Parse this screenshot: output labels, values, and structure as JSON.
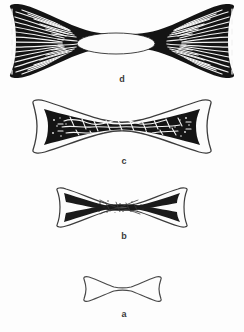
{
  "figure": {
    "background_color": "#fdfdfd",
    "ink_color": "#1a1a1a",
    "outline_color": "#4a4a4a",
    "label_color": "#3a3a3a",
    "orientation": "vertical stack, labels beneath each specimen"
  },
  "specimens": [
    {
      "id": "d",
      "label": "d",
      "order_from_top": 1,
      "width_px": 230,
      "height_px": 62,
      "center_x": 122,
      "center_y": 41,
      "fill": "solid-black-cortex",
      "internal_texture": "radiating fan trabeculae",
      "has_medullary_cavity": true,
      "cavity_width_px": 78,
      "cavity_height_px": 22,
      "description": "Largest specimen; strongly flared ends filled with dense fan-shaped radiating trabeculae, thick black cortex and a large open elliptical medullary cavity at the midshaft."
    },
    {
      "id": "c",
      "label": "c",
      "order_from_top": 2,
      "width_px": 186,
      "height_px": 52,
      "center_x": 122,
      "center_y": 126,
      "fill": "black-midshaft-with-open-ends",
      "internal_texture": "reticular mesh trabeculae",
      "has_medullary_cavity": false,
      "description": "Flared hollow ends with pale interiors; midshaft occupied by a thick black band carrying a coarse reticular mesh of trabeculae."
    },
    {
      "id": "b",
      "label": "b",
      "order_from_top": 3,
      "width_px": 136,
      "height_px": 38,
      "center_x": 122,
      "center_y": 207,
      "fill": "thin-black-margins",
      "internal_texture": "sparse stippled trabeculae",
      "has_medullary_cavity": false,
      "description": "Smaller hourglass outline with thin dark upper and lower cortical margins and a small patch of sparse stippled trabecular texture at the centre."
    },
    {
      "id": "a",
      "label": "a",
      "order_from_top": 4,
      "width_px": 82,
      "height_px": 24,
      "center_x": 122,
      "center_y": 289,
      "fill": "outline-only",
      "internal_texture": "none",
      "has_medullary_cavity": false,
      "description": "Smallest specimen; plain unshaded hourglass outline with no internal structure."
    }
  ]
}
